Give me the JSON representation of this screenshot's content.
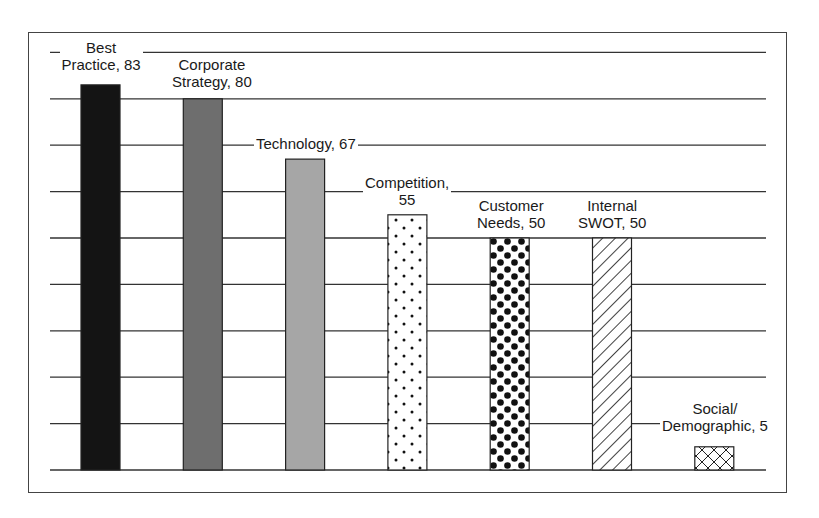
{
  "chart_data": {
    "type": "bar",
    "title": "",
    "xlabel": "",
    "ylabel": "",
    "categories": [
      "Best Practice",
      "Corporate Strategy",
      "Technology",
      "Competition",
      "Customer Needs",
      "Internal SWOT",
      "Social/Demographic"
    ],
    "values": [
      83,
      80,
      67,
      55,
      50,
      50,
      5
    ],
    "labels": [
      [
        "Best",
        "Practice, 83"
      ],
      [
        "Corporate",
        "Strategy, 80"
      ],
      [
        "Technology, 67"
      ],
      [
        "Competition,",
        "55"
      ],
      [
        "Customer",
        "Needs, 50"
      ],
      [
        "Internal",
        "SWOT, 50"
      ],
      [
        "Social/",
        "Demographic, 5"
      ]
    ],
    "fills": [
      "solid-black",
      "solid-dark-gray",
      "solid-light-gray",
      "sparse-dots",
      "dense-dots",
      "diagonal-hatch",
      "cross-hatch"
    ],
    "ylim": [
      0,
      100
    ],
    "grid": true,
    "grid_step": 10,
    "axis_ticks_shown": false,
    "legend": "none"
  },
  "colors": {
    "frame": "#444444",
    "grid": "#333333",
    "bar_black": "#141414",
    "bar_dark_gray": "#6e6e6e",
    "bar_light_gray": "#a6a6a6"
  }
}
